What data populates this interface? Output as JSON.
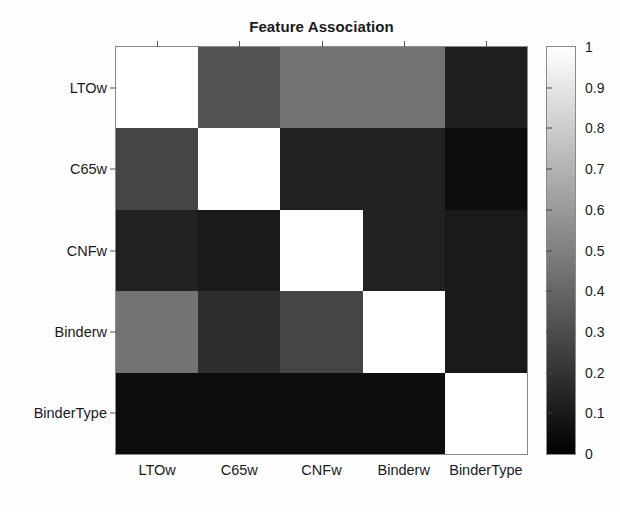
{
  "chart_data": {
    "type": "heatmap",
    "title": "Feature Association",
    "xlabel": "",
    "ylabel": "",
    "categories": [
      "LTOw",
      "C65w",
      "CNFw",
      "Binderw",
      "BinderType"
    ],
    "x_tick_labels": [
      "LTOw",
      "C65w",
      "CNFw",
      "Binderw",
      "BinderType"
    ],
    "y_tick_labels": [
      "LTOw",
      "C65w",
      "CNFw",
      "Binderw",
      "BinderType"
    ],
    "colormap": "gray",
    "zlim": [
      0,
      1
    ],
    "grid": false,
    "legend": "none",
    "colorbar": {
      "position": "right",
      "min": 0,
      "max": 1,
      "tick_labels": [
        "1",
        "0.9",
        "0.8",
        "0.7",
        "0.6",
        "0.5",
        "0.4",
        "0.3",
        "0.2",
        "0.1",
        "0"
      ],
      "tick_values": [
        1,
        0.9,
        0.8,
        0.7,
        0.6,
        0.5,
        0.4,
        0.3,
        0.2,
        0.1,
        0
      ],
      "low_color": "#000000",
      "high_color": "#ffffff"
    },
    "rows": [
      {
        "name": "LTOw",
        "values": [
          1.0,
          0.33,
          0.45,
          0.45,
          0.12
        ]
      },
      {
        "name": "C65w",
        "values": [
          0.27,
          1.0,
          0.13,
          0.13,
          0.05
        ]
      },
      {
        "name": "CNFw",
        "values": [
          0.13,
          0.1,
          1.0,
          0.13,
          0.1
        ]
      },
      {
        "name": "Binderw",
        "values": [
          0.45,
          0.18,
          0.27,
          1.0,
          0.1
        ]
      },
      {
        "name": "BinderType",
        "values": [
          0.05,
          0.05,
          0.05,
          0.05,
          1.0
        ]
      }
    ]
  }
}
